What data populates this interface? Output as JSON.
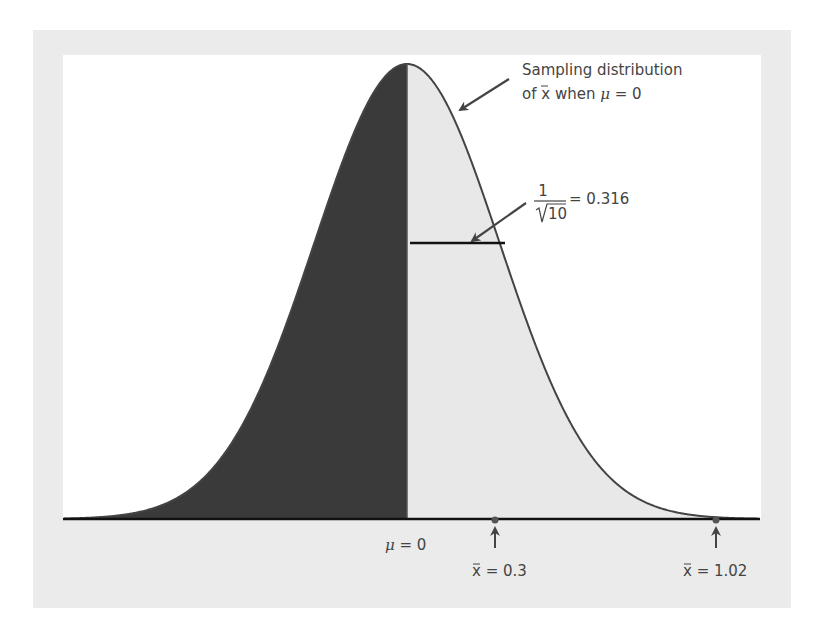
{
  "figure": {
    "frame_color": "#ebebeb",
    "plot_bg": "#ffffff",
    "left_fill": "#3a3a3a",
    "right_fill": "#e8e8e8",
    "curve_color": "#444444"
  },
  "annotations": {
    "curve_label_line1": "Sampling distribution",
    "curve_label_line2_prefix": "of ",
    "curve_label_xbar": "x",
    "curve_label_line2_mid": " when ",
    "curve_label_mu": "μ",
    "curve_label_line2_suffix": " = 0",
    "sd_numerator": "1",
    "sd_denominator": "10",
    "sd_value": "= 0.316"
  },
  "axis": {
    "mu_symbol": "μ",
    "mu_label_suffix": " = 0",
    "markers": [
      {
        "symbol": "x",
        "label_suffix": " = 0.3",
        "value": 0.3
      },
      {
        "symbol": "x",
        "label_suffix": " = 1.02",
        "value": 1.02
      }
    ]
  },
  "chart_data": {
    "type": "area",
    "distribution": "normal",
    "mean": 0,
    "standard_deviation": 0.316,
    "sd_formula": "1/sqrt(10)",
    "shaded_region": "x̄ < 0 (dark), x̄ > 0 (light)",
    "marked_points": [
      {
        "label": "μ = 0",
        "x": 0
      },
      {
        "label": "x̄ = 0.3",
        "x": 0.3
      },
      {
        "label": "x̄ = 1.02",
        "x": 1.02
      }
    ],
    "xlabel": "",
    "ylabel": "",
    "grid": false
  }
}
